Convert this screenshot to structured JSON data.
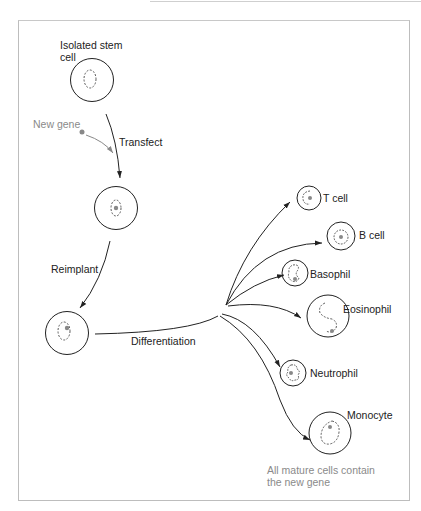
{
  "labels": {
    "isolated_stem_cell_line1": "Isolated stem",
    "isolated_stem_cell_line2": "cell",
    "new_gene": "New gene",
    "transfect": "Transfect",
    "reimplant": "Reimplant",
    "differentiation": "Differentiation",
    "footnote_line1": "All mature cells contain",
    "footnote_line2": "the new gene"
  },
  "mature_cells": [
    {
      "name": "T cell"
    },
    {
      "name": "B cell"
    },
    {
      "name": "Basophil"
    },
    {
      "name": "Eosinophil"
    },
    {
      "name": "Neutrophil"
    },
    {
      "name": "Monocyte"
    }
  ],
  "colors": {
    "stroke": "#222222",
    "gene_dot": "#888888",
    "gray_text": "#8a8a8a",
    "frame": "#bdbdbd"
  }
}
